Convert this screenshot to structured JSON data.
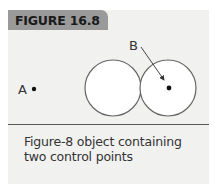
{
  "figure": {
    "label": "FIGURE 16.8",
    "caption": "Figure-8 object containing two control points"
  },
  "diagram": {
    "points": [
      {
        "id": "A",
        "label": "A",
        "location": "outside the figure-8, to the left"
      },
      {
        "id": "B",
        "label": "B",
        "location": "center of right circle, indicated by arrow"
      }
    ],
    "shapes": [
      {
        "type": "circle",
        "role": "left loop of figure-8"
      },
      {
        "type": "circle",
        "role": "right loop of figure-8"
      }
    ],
    "colors": {
      "panel": "#f1f1f0",
      "label_bg": "#9a9a9a",
      "stroke": "#555555",
      "circle_fill": "#ffffff"
    }
  }
}
